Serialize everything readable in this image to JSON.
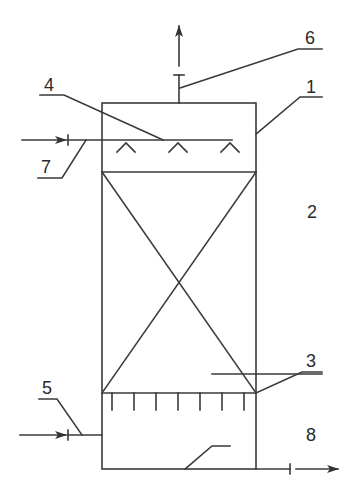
{
  "diagram": {
    "type": "packed tower schematic",
    "labels": [
      {
        "id": "1",
        "text": "1",
        "refers_to": "tower shell"
      },
      {
        "id": "2",
        "text": "2",
        "refers_to": "packing layer"
      },
      {
        "id": "3",
        "text": "3",
        "refers_to": "packing support / gas distributor"
      },
      {
        "id": "4",
        "text": "4",
        "refers_to": "liquid spray distributor"
      },
      {
        "id": "5",
        "text": "5",
        "refers_to": "gas inlet"
      },
      {
        "id": "6",
        "text": "6",
        "refers_to": "gas outlet"
      },
      {
        "id": "7",
        "text": "7",
        "refers_to": "liquid inlet"
      },
      {
        "id": "8",
        "text": "8",
        "refers_to": "liquid outlet"
      }
    ],
    "colors": {
      "line": "#3a3a3a",
      "background": "#ffffff"
    }
  }
}
